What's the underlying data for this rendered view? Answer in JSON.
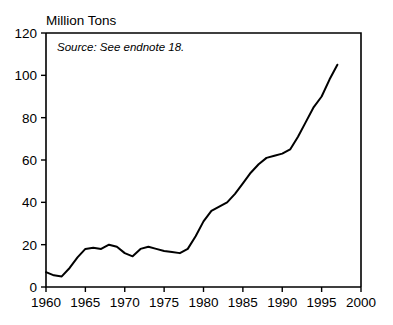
{
  "chart_data": {
    "type": "line",
    "title": "",
    "ylabel": "Million Tons",
    "xlabel": "",
    "annotation": "Source: See endnote 18.",
    "xlim": [
      1960,
      2000
    ],
    "ylim": [
      0,
      120
    ],
    "xticks": [
      1960,
      1965,
      1970,
      1975,
      1980,
      1985,
      1990,
      1995,
      2000
    ],
    "yticks": [
      0,
      20,
      40,
      60,
      80,
      100,
      120
    ],
    "xtick_labels": [
      "1960",
      "1965",
      "1970",
      "1975",
      "1980",
      "1985",
      "1990",
      "1995",
      "2000"
    ],
    "ytick_labels": [
      "0",
      "20",
      "40",
      "60",
      "80",
      "100",
      "120"
    ],
    "grid": false,
    "legend": null,
    "line_color": "#000000",
    "x": [
      1960,
      1961,
      1962,
      1963,
      1964,
      1965,
      1966,
      1967,
      1968,
      1969,
      1970,
      1971,
      1972,
      1973,
      1974,
      1975,
      1976,
      1977,
      1978,
      1979,
      1980,
      1981,
      1982,
      1983,
      1984,
      1985,
      1986,
      1987,
      1988,
      1989,
      1990,
      1991,
      1992,
      1993,
      1994,
      1995,
      1996,
      1997
    ],
    "values": [
      7,
      5.5,
      5,
      9,
      14,
      18,
      18.5,
      18,
      20,
      19,
      16,
      14.5,
      18,
      19,
      18,
      17,
      16.5,
      16,
      18,
      24,
      31,
      36,
      38,
      40,
      44,
      49,
      54,
      58,
      61,
      62,
      63,
      65,
      71,
      78,
      85,
      90,
      98,
      105
    ]
  }
}
